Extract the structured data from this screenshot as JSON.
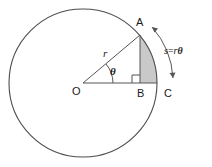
{
  "figure": {
    "labels": {
      "center": "O",
      "point_a": "A",
      "point_b": "B",
      "point_c": "C",
      "radius": "r",
      "angle": "θ",
      "arc_s": "s",
      "arc_equals": "=",
      "arc_r": "r",
      "arc_theta": "θ"
    },
    "colors": {
      "stroke": "#4d4d4d",
      "line": "#555555",
      "shade_fill": "#c9c9c9",
      "text": "#1a1a1a",
      "background": "#ffffff"
    },
    "geometry": {
      "center_x": 83,
      "center_y": 83,
      "radius": 74,
      "angle_degrees": 40,
      "point_a_x": 140,
      "point_a_y": 35,
      "point_b_x": 140,
      "point_b_y": 83,
      "point_c_x": 157,
      "point_c_y": 83
    }
  }
}
